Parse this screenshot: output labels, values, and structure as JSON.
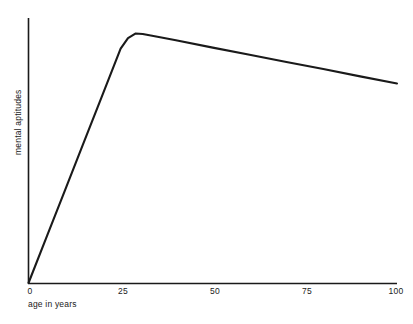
{
  "chart_data": {
    "type": "line",
    "title": "",
    "subtitle": "",
    "xlabel": "age in years",
    "ylabel": "mental aptitudes",
    "xlim": [
      0,
      100
    ],
    "ylim": [
      0,
      1
    ],
    "grid": false,
    "legend": null,
    "legend_position": "none",
    "xticks": [
      0,
      25,
      50,
      75,
      100
    ],
    "xtick_labels": [
      "0",
      "25",
      "50",
      "75",
      "100"
    ],
    "yticks": [],
    "ytick_labels": [],
    "annotations": [],
    "series": [
      {
        "name": "mental aptitudes",
        "color": "#1a1a1a",
        "x": [
          0,
          5,
          10,
          15,
          20,
          25,
          27,
          29,
          31,
          35,
          40,
          50,
          60,
          70,
          80,
          90,
          100
        ],
        "values": [
          0.0,
          0.186,
          0.372,
          0.558,
          0.744,
          0.93,
          0.972,
          0.99,
          0.988,
          0.977,
          0.963,
          0.934,
          0.906,
          0.877,
          0.849,
          0.82,
          0.792
        ]
      }
    ]
  },
  "axis": {
    "x_title": "age in years",
    "y_title": "mental aptitudes",
    "tick_0": "0",
    "tick_25": "25",
    "tick_50": "50",
    "tick_75": "75",
    "tick_100": "100"
  },
  "colors": {
    "line": "#1a1a1a",
    "axis": "#1a1a1a",
    "background": "#ffffff"
  }
}
